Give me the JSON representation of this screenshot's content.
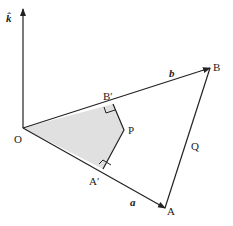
{
  "diagram": {
    "axis_label": "k̂",
    "points": {
      "O": {
        "label": "O",
        "x": 23,
        "y": 128
      },
      "A": {
        "label": "A",
        "x": 165,
        "y": 208
      },
      "B": {
        "label": "B",
        "x": 210,
        "y": 68
      },
      "A_prime": {
        "label": "A′",
        "x": 103,
        "y": 169
      },
      "B_prime": {
        "label": "B′",
        "x": 113,
        "y": 104
      },
      "P": {
        "label": "P",
        "x": 124,
        "y": 130
      }
    },
    "vector_labels": {
      "a": "a",
      "b": "b"
    },
    "side_label_Q": "Q",
    "colors": {
      "shade": "#e0e0e0",
      "line": "#222222"
    }
  }
}
